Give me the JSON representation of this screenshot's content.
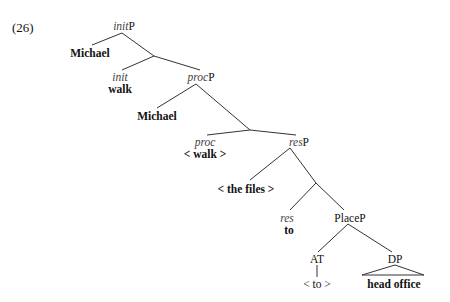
{
  "example_number": "(26)",
  "tree": {
    "initP": {
      "head_italic": "init",
      "suffix": "P"
    },
    "spec_init": "Michael",
    "init_head": {
      "label": "init",
      "word": "walk"
    },
    "procP": {
      "head_italic": "proc",
      "suffix": "P"
    },
    "spec_proc": "Michael",
    "proc_head": {
      "label": "proc",
      "word": "< walk >"
    },
    "resP": {
      "head_italic": "res",
      "suffix": "P"
    },
    "spec_res": "< the files >",
    "res_head": {
      "label": "res",
      "word": "to"
    },
    "placeP": "PlaceP",
    "at": {
      "label": "AT",
      "word": "< to >"
    },
    "dp": {
      "label": "DP",
      "word": "head office"
    }
  }
}
